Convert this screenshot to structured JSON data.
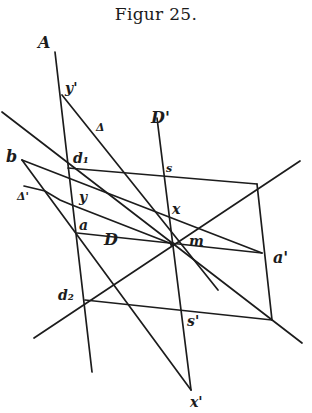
{
  "figure": {
    "caption": "Figur 25.",
    "ink_color": "#1c1c1c",
    "background": "#ffffff"
  },
  "labels": {
    "A": "A",
    "y_prime": "y'",
    "delta": "Δ",
    "D_prime": "D'",
    "b": "b",
    "d1": "d₁",
    "s": "s",
    "delta_prime": "Δ'",
    "y": "y",
    "x": "x",
    "a": "a",
    "D": "D",
    "m": "m",
    "a_prime": "a'",
    "d2": "d₂",
    "s_prime": "s'",
    "x_prime": "x'"
  },
  "points": {
    "A_top": [
      55,
      52
    ],
    "y_prime": [
      62,
      95
    ],
    "d1": [
      68,
      168
    ],
    "y": [
      72,
      205
    ],
    "a": [
      77,
      233
    ],
    "d2": [
      85,
      300
    ],
    "A_bottom": [
      92,
      372
    ],
    "D_prime_top": [
      157,
      118
    ],
    "s": [
      161,
      173
    ],
    "x": [
      166,
      215
    ],
    "m": [
      172,
      244
    ],
    "s_prime": [
      181,
      311
    ],
    "x_prime": [
      191,
      390
    ],
    "b": [
      22,
      160
    ],
    "corner_tr": [
      257,
      184
    ],
    "a_prime": [
      262,
      253
    ],
    "corner_br": [
      272,
      320
    ]
  }
}
